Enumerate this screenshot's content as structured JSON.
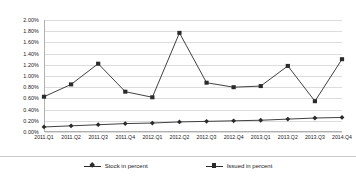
{
  "chart_data": {
    "type": "line",
    "title": "",
    "xlabel": "",
    "ylabel": "",
    "ylim": [
      0,
      2.0
    ],
    "ytick_labels": [
      "2.00%",
      "1.80%",
      "1.60%",
      "1.40%",
      "1.20%",
      "1.00%",
      "0.80%",
      "0.60%",
      "0.40%",
      "0.20%",
      "0.00%"
    ],
    "ytick_values": [
      2.0,
      1.8,
      1.6,
      1.4,
      1.2,
      1.0,
      0.8,
      0.6,
      0.4,
      0.2,
      0.0
    ],
    "grid": true,
    "legend_position": "bottom",
    "categories": [
      "2011.Q1",
      "2011.Q2",
      "2011.Q3",
      "2011.Q4",
      "2012.Q1",
      "2012.Q2",
      "2012.Q3",
      "2012.Q4",
      "2013.Q1",
      "2013.Q2",
      "2013.Q3",
      "2014.Q4"
    ],
    "series": [
      {
        "name": "Stock in percent",
        "marker": "diamond",
        "color": "#2b2b2b",
        "values": [
          0.09,
          0.11,
          0.13,
          0.15,
          0.16,
          0.18,
          0.19,
          0.2,
          0.21,
          0.23,
          0.25,
          0.26
        ]
      },
      {
        "name": "Issued in percent",
        "marker": "square",
        "color": "#2b2b2b",
        "values": [
          0.63,
          0.85,
          1.22,
          0.72,
          0.62,
          1.77,
          0.88,
          0.8,
          0.82,
          1.18,
          0.55,
          1.3
        ]
      }
    ]
  },
  "legend": {
    "items": [
      {
        "label": "Stock in percent"
      },
      {
        "label": "Issued in percent"
      }
    ]
  }
}
